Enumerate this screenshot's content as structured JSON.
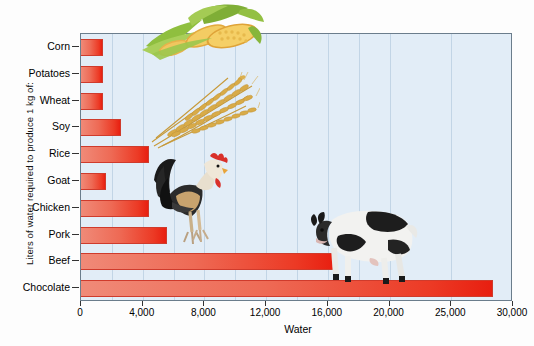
{
  "chart_data": {
    "type": "bar",
    "orientation": "horizontal",
    "title": "",
    "xlabel": "Water",
    "ylabel": "Liters of water required to produce 1 kg of:",
    "categories": [
      "Corn",
      "Potatoes",
      "Wheat",
      "Soy",
      "Rice",
      "Goat",
      "Chicken",
      "Pork",
      "Beef",
      "Chocolate"
    ],
    "values": [
      1400,
      1400,
      1400,
      2600,
      4400,
      1600,
      4400,
      5600,
      16400,
      28400
    ],
    "xlim": [
      0,
      30000
    ],
    "xticks": [
      0,
      4000,
      8000,
      12000,
      16000,
      20000,
      25000,
      30000
    ],
    "xticklabels": [
      "0",
      "4,000",
      "8,000",
      "12,000",
      "16,000",
      "20,000",
      "25,000",
      "30,000"
    ],
    "grid": "vertical",
    "legend": "none",
    "bar_color_start": "#f08a78",
    "bar_color_end": "#e81f10",
    "plot_background": "#e2edf7",
    "gridline_color": "#c2d5e6",
    "annotations": [
      "corn-photo",
      "wheat-photo",
      "rooster-photo",
      "cow-photo"
    ]
  },
  "axis": {
    "x_title": "Water",
    "y_title": "Liters of water required to produce 1 kg of:"
  },
  "photos": {
    "corn": "corn-photo",
    "wheat": "wheat-photo",
    "rooster": "rooster-photo",
    "cow": "cow-photo"
  }
}
